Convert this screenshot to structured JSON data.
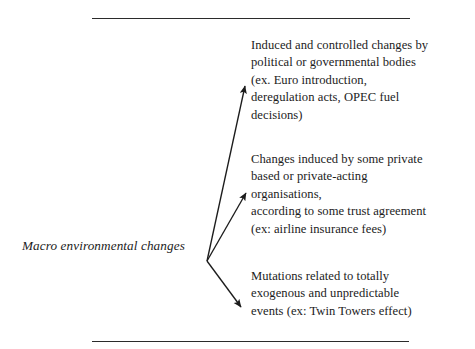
{
  "figure": {
    "title": "",
    "source_label": "Macro environmental changes",
    "rules": [
      {
        "name": "top-rule"
      },
      {
        "name": "bottom-rule"
      }
    ],
    "branches": [
      {
        "id": "political",
        "text": "Induced and controlled changes by\npolitical or governmental bodies\n(ex. Euro introduction,\nderegulation acts, OPEC fuel\ndecisions)"
      },
      {
        "id": "private",
        "text": "Changes induced by some private\nbased or private-acting\norganisations,\naccording to some trust agreement\n(ex: airline insurance fees)"
      },
      {
        "id": "exogenous",
        "text": "Mutations related to totally\nexogenous and unpredictable\nevents (ex: Twin Towers effect)"
      }
    ],
    "arrows": [
      {
        "name": "arrow-to-political",
        "from_x": 207,
        "from_y": 261,
        "to_x": 245,
        "to_y": 82
      },
      {
        "name": "arrow-to-private",
        "from_x": 207,
        "from_y": 261,
        "to_x": 247,
        "to_y": 190
      },
      {
        "name": "arrow-to-exogenous",
        "from_x": 207,
        "from_y": 261,
        "to_x": 244,
        "to_y": 311
      }
    ],
    "colors": {
      "ink": "#1c1c1c",
      "rule": "#2b2b2b",
      "background": "#ffffff"
    }
  }
}
